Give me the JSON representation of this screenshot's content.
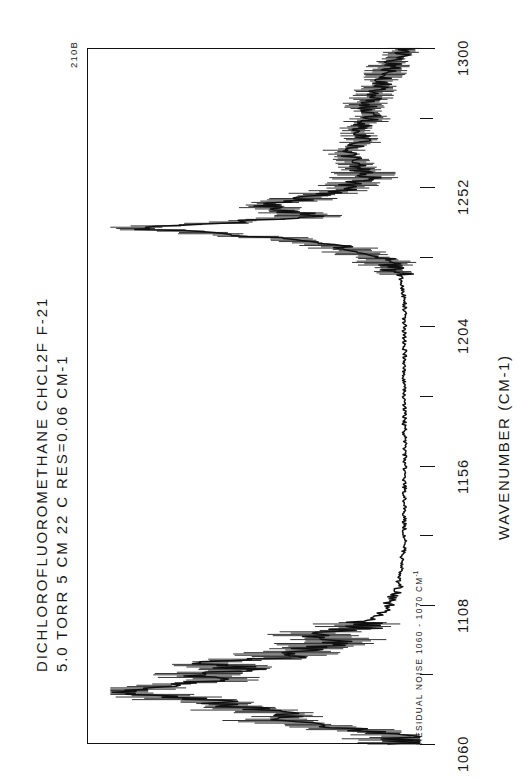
{
  "document": {
    "corner_code": "210B"
  },
  "header": {
    "line1": "DICHLOROFLUOROMETHANE   CHCL2F   F-21",
    "line2": "5.0 TORR  5 CM  22 C        RES=0.06 CM-1",
    "compound_name": "DICHLOROFLUOROMETHANE",
    "formula": "CHCL2F",
    "refrigerant_code": "F-21",
    "pressure": "5.0 TORR",
    "path_length": "5 CM",
    "temperature": "22 C",
    "resolution": "RES=0.06 CM-1"
  },
  "annotations": {
    "residual_noise_prefix": "RESIDUAL NOISE 1060 - 1070 CM",
    "residual_noise_exponent": "-1"
  },
  "axis": {
    "title": "WAVENUMBER  (CM-1)",
    "tick_labels": [
      "1060",
      "1108",
      "1156",
      "1204",
      "1252",
      "1300"
    ],
    "minor_between": 1
  },
  "chart_data": {
    "type": "line",
    "title": "DICHLOROFLUOROMETHANE   CHCL2F   F-21",
    "subtitle": "5.0 TORR  5 CM  22 C        RES=0.06 CM-1",
    "orientation": "wavenumber-vertical-absorbance-horizontal",
    "xlabel": "WAVENUMBER  (CM-1)",
    "ylabel": "ABSORBANCE",
    "xlim": [
      1060,
      1300
    ],
    "ylim": [
      0,
      1
    ],
    "grid": false,
    "legend": null,
    "tick_values": [
      1060,
      1108,
      1156,
      1204,
      1252,
      1300
    ],
    "minor_tick_values": [
      1084,
      1132,
      1180,
      1228,
      1276
    ],
    "bands": [
      {
        "center": 1068,
        "label": "noise region onset",
        "relative_intensity": 0.55
      },
      {
        "center": 1078,
        "label": "strong Q-branch cluster",
        "relative_intensity": 0.95
      },
      {
        "center": 1088,
        "label": "band shoulder",
        "relative_intensity": 0.7
      },
      {
        "center": 1098,
        "label": "P-branch tail",
        "relative_intensity": 0.35
      },
      {
        "center": 1238,
        "label": "strong sharp Q-branch",
        "relative_intensity": 0.92
      },
      {
        "center": 1246,
        "label": "secondary band",
        "relative_intensity": 0.5
      },
      {
        "center": 1262,
        "label": "weak structure",
        "relative_intensity": 0.22
      },
      {
        "center": 1285,
        "label": "weak structure",
        "relative_intensity": 0.15
      }
    ],
    "x": [
      1060,
      1062,
      1064,
      1066,
      1068,
      1070,
      1072,
      1074,
      1076,
      1078,
      1080,
      1082,
      1084,
      1086,
      1088,
      1090,
      1092,
      1094,
      1096,
      1098,
      1100,
      1104,
      1108,
      1112,
      1116,
      1120,
      1124,
      1128,
      1132,
      1136,
      1140,
      1148,
      1156,
      1164,
      1172,
      1180,
      1188,
      1196,
      1204,
      1212,
      1220,
      1226,
      1230,
      1234,
      1236,
      1238,
      1240,
      1242,
      1244,
      1246,
      1248,
      1252,
      1256,
      1260,
      1264,
      1268,
      1272,
      1276,
      1280,
      1284,
      1288,
      1292,
      1296,
      1300
    ],
    "y": [
      0.02,
      0.05,
      0.12,
      0.3,
      0.46,
      0.4,
      0.55,
      0.62,
      0.78,
      0.95,
      0.86,
      0.62,
      0.7,
      0.58,
      0.66,
      0.44,
      0.38,
      0.3,
      0.24,
      0.34,
      0.2,
      0.14,
      0.1,
      0.08,
      0.07,
      0.06,
      0.06,
      0.05,
      0.05,
      0.05,
      0.05,
      0.05,
      0.05,
      0.05,
      0.05,
      0.05,
      0.05,
      0.05,
      0.05,
      0.05,
      0.06,
      0.1,
      0.2,
      0.4,
      0.66,
      0.92,
      0.6,
      0.34,
      0.44,
      0.5,
      0.36,
      0.22,
      0.16,
      0.2,
      0.24,
      0.18,
      0.2,
      0.15,
      0.17,
      0.14,
      0.12,
      0.1,
      0.08,
      0.04
    ]
  }
}
